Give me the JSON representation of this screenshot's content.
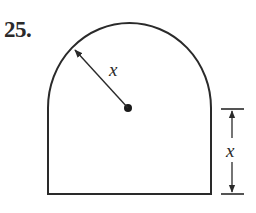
{
  "problem": {
    "number": "25."
  },
  "figure": {
    "shape": "semicircle on top of rectangle (arch / window shape)",
    "radius_label": "x",
    "height_label": "x",
    "stroke_color": "#2a2a2a",
    "background_color": "#ffffff"
  }
}
